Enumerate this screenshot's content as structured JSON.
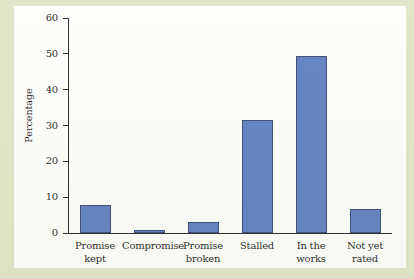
{
  "chart_data": {
    "type": "bar",
    "title": "",
    "xlabel": "",
    "ylabel": "Percentage",
    "ylim": [
      0,
      60
    ],
    "yticks": [
      0,
      10,
      20,
      30,
      40,
      50,
      60
    ],
    "ytick_labels": [
      "0",
      "10",
      "20",
      "30",
      "40",
      "50",
      "60"
    ],
    "grid": false,
    "legend": false,
    "bar_color": "#5578bd",
    "bar_edge_color": "#2e3f6b",
    "background_color": "#dde3c4",
    "panel_color": "#fdfdfb",
    "categories": [
      "Promise\nkept",
      "Compromise",
      "Promise\nbroken",
      "Stalled",
      "In the\nworks",
      "Not yet\nrated"
    ],
    "values": [
      7.8,
      0.8,
      3.0,
      31.6,
      49.4,
      6.6
    ]
  }
}
